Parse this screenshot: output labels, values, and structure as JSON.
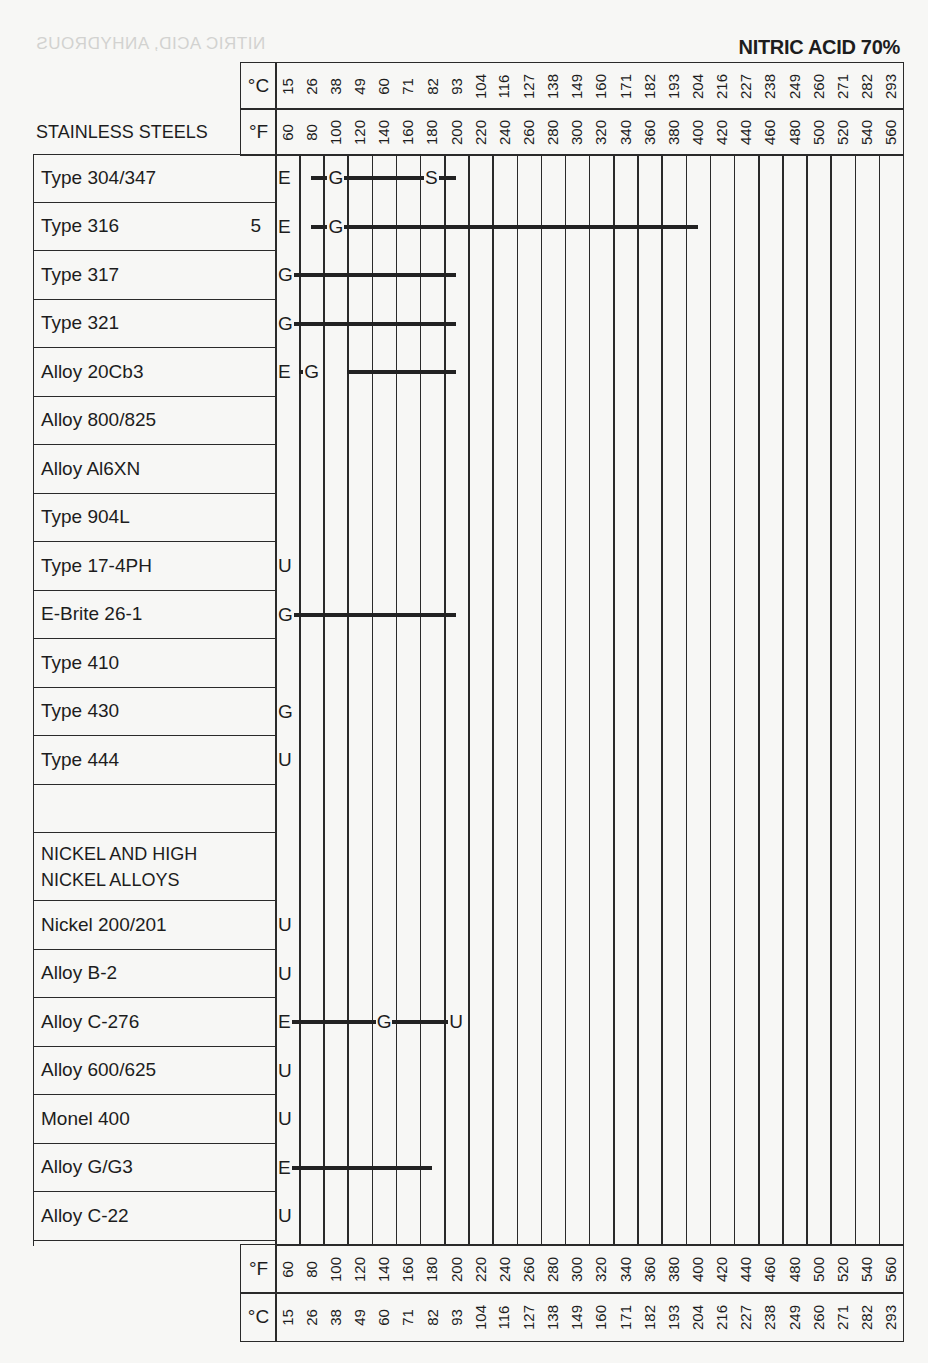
{
  "chart_data": {
    "type": "table",
    "title": "NITRIC ACID 70%",
    "ghost_text": "NITRIC ACID, ANHYDROUS",
    "section_header": "STAINLESS STEELS",
    "axis_units": {
      "celsius": "°C",
      "fahrenheit": "°F"
    },
    "fahrenheit_ticks": [
      "60",
      "80",
      "100",
      "120",
      "140",
      "160",
      "180",
      "200",
      "220",
      "240",
      "260",
      "280",
      "300",
      "320",
      "340",
      "360",
      "380",
      "400",
      "420",
      "440",
      "460",
      "480",
      "500",
      "520",
      "540",
      "560"
    ],
    "celsius_ticks": [
      "15",
      "26",
      "38",
      "49",
      "60",
      "71",
      "82",
      "93",
      "104",
      "116",
      "127",
      "138",
      "149",
      "160",
      "171",
      "182",
      "193",
      "204",
      "216",
      "227",
      "238",
      "249",
      "260",
      "271",
      "282",
      "293"
    ],
    "rating_legend": {
      "E": "Excellent",
      "G": "Good",
      "S": "Satisfactory",
      "U": "Unsatisfactory"
    },
    "rows": [
      {
        "label": "Type 304/347",
        "note": "",
        "marks": [
          {
            "r": "E",
            "f": 60
          },
          {
            "r": "G",
            "f": 100
          },
          {
            "r": "S",
            "f": 180
          }
        ],
        "bars": [
          [
            80,
            100
          ],
          [
            100,
            180
          ],
          [
            180,
            200
          ]
        ]
      },
      {
        "label": "Type 316",
        "note": "5",
        "marks": [
          {
            "r": "E",
            "f": 60
          },
          {
            "r": "G",
            "f": 100
          }
        ],
        "bars": [
          [
            80,
            100
          ],
          [
            100,
            400
          ]
        ]
      },
      {
        "label": "Type 317",
        "note": "",
        "marks": [
          {
            "r": "G",
            "f": 60
          }
        ],
        "bars": [
          [
            60,
            200
          ]
        ]
      },
      {
        "label": "Type 321",
        "note": "",
        "marks": [
          {
            "r": "G",
            "f": 60
          }
        ],
        "bars": [
          [
            60,
            200
          ]
        ]
      },
      {
        "label": "Alloy 20Cb3",
        "note": "",
        "marks": [
          {
            "r": "E",
            "f": 60
          },
          {
            "r": "G",
            "f": 80
          }
        ],
        "bars": [
          [
            70,
            80
          ],
          [
            110,
            200
          ]
        ]
      },
      {
        "label": "Alloy 800/825",
        "note": "",
        "marks": [],
        "bars": []
      },
      {
        "label": "Alloy Al6XN",
        "note": "",
        "marks": [],
        "bars": []
      },
      {
        "label": "Type 904L",
        "note": "",
        "marks": [],
        "bars": []
      },
      {
        "label": "Type 17-4PH",
        "note": "",
        "marks": [
          {
            "r": "U",
            "f": 60
          }
        ],
        "bars": []
      },
      {
        "label": "E-Brite 26-1",
        "note": "",
        "marks": [
          {
            "r": "G",
            "f": 60
          }
        ],
        "bars": [
          [
            60,
            200
          ]
        ]
      },
      {
        "label": "Type 410",
        "note": "",
        "marks": [],
        "bars": []
      },
      {
        "label": "Type 430",
        "note": "",
        "marks": [
          {
            "r": "G",
            "f": 60
          }
        ],
        "bars": []
      },
      {
        "label": "Type 444",
        "note": "",
        "marks": [
          {
            "r": "U",
            "f": 60
          }
        ],
        "bars": []
      },
      {
        "label": "",
        "note": "",
        "marks": [],
        "bars": []
      },
      {
        "label": "NICKEL AND HIGH NICKEL ALLOYS",
        "note": "",
        "header": true,
        "marks": [],
        "bars": []
      },
      {
        "label": "Nickel 200/201",
        "note": "",
        "marks": [
          {
            "r": "U",
            "f": 60
          }
        ],
        "bars": []
      },
      {
        "label": "Alloy B-2",
        "note": "",
        "marks": [
          {
            "r": "U",
            "f": 60
          }
        ],
        "bars": []
      },
      {
        "label": "Alloy C-276",
        "note": "",
        "marks": [
          {
            "r": "E",
            "f": 60
          },
          {
            "r": "G",
            "f": 140
          },
          {
            "r": "U",
            "f": 200
          }
        ],
        "bars": [
          [
            60,
            140
          ],
          [
            140,
            200
          ]
        ]
      },
      {
        "label": "Alloy 600/625",
        "note": "",
        "marks": [
          {
            "r": "U",
            "f": 60
          }
        ],
        "bars": []
      },
      {
        "label": "Monel 400",
        "note": "",
        "marks": [
          {
            "r": "U",
            "f": 60
          }
        ],
        "bars": []
      },
      {
        "label": "Alloy G/G3",
        "note": "",
        "marks": [
          {
            "r": "E",
            "f": 60
          }
        ],
        "bars": [
          [
            60,
            180
          ]
        ]
      },
      {
        "label": "Alloy C-22",
        "note": "",
        "marks": [
          {
            "r": "U",
            "f": 60
          }
        ],
        "bars": []
      }
    ]
  },
  "labels": {
    "title": "NITRIC ACID 70%",
    "ghost": "NITRIC ACID, ANHYDROUS",
    "section": "STAINLESS STEELS",
    "nickel_line1": "NICKEL AND HIGH",
    "nickel_line2": "NICKEL ALLOYS",
    "unit_c": "°C",
    "unit_f": "°F"
  }
}
